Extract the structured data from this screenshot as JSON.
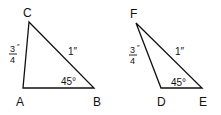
{
  "figure": {
    "triangles": [
      {
        "name": "ABC",
        "vertices": {
          "A": "A",
          "B": "B",
          "C": "C"
        },
        "side_AC": {
          "num": "3",
          "den": "4",
          "unit": "″"
        },
        "side_CB": "1″",
        "angle_B": "45°"
      },
      {
        "name": "DEF",
        "vertices": {
          "D": "D",
          "E": "E",
          "F": "F"
        },
        "side_FD": {
          "num": "3",
          "den": "4",
          "unit": "″"
        },
        "side_FE": "1″",
        "angle_E": "45°"
      }
    ],
    "stroke_color": "#111111"
  }
}
